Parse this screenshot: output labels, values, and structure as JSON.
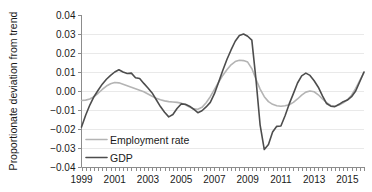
{
  "chart_data": {
    "type": "line",
    "title": "",
    "subtitle": "",
    "xlabel": "",
    "ylabel": "Proportionate deviation from trend",
    "xlim": [
      1999.0,
      2016.0
    ],
    "ylim": [
      -0.04,
      0.04
    ],
    "grid": true,
    "grid_axis": "y",
    "legend_position": "inside-bottom-left",
    "y_ticks": [
      0.04,
      0.03,
      0.02,
      0.01,
      0.0,
      -0.01,
      -0.02,
      -0.03,
      -0.04
    ],
    "y_tick_labels": [
      "0.04",
      "0.03",
      "0.02",
      "0.01",
      "0.00",
      "−0.01",
      "−0.02",
      "−0.03",
      "−0.04"
    ],
    "x_ticks": [
      1999,
      2001,
      2003,
      2005,
      2007,
      2009,
      2011,
      2013,
      2015
    ],
    "x_tick_labels": [
      "1999",
      "2001",
      "2003",
      "2005",
      "2007",
      "2009",
      "2011",
      "2013",
      "2015"
    ],
    "x_minor_tick_interval": 0.25,
    "series": [
      {
        "name": "Employment rate",
        "color": "#b4b4b4",
        "width": 1.6,
        "x": [
          1999.0,
          1999.25,
          1999.5,
          1999.75,
          2000.0,
          2000.25,
          2000.5,
          2000.75,
          2001.0,
          2001.25,
          2001.5,
          2001.75,
          2002.0,
          2002.25,
          2002.5,
          2002.75,
          2003.0,
          2003.25,
          2003.5,
          2003.75,
          2004.0,
          2004.25,
          2004.5,
          2004.75,
          2005.0,
          2005.25,
          2005.5,
          2005.75,
          2006.0,
          2006.25,
          2006.5,
          2006.75,
          2007.0,
          2007.25,
          2007.5,
          2007.75,
          2008.0,
          2008.25,
          2008.5,
          2008.75,
          2009.0,
          2009.25,
          2009.5,
          2009.75,
          2010.0,
          2010.25,
          2010.5,
          2010.75,
          2011.0,
          2011.25,
          2011.5,
          2011.75,
          2012.0,
          2012.25,
          2012.5,
          2012.75,
          2013.0,
          2013.25,
          2013.5,
          2013.75,
          2014.0,
          2014.25,
          2014.5,
          2014.75,
          2015.0,
          2015.25,
          2015.5,
          2015.75,
          2016.0
        ],
        "values": [
          -0.005,
          -0.0048,
          -0.0042,
          -0.003,
          -0.0012,
          0.0008,
          0.0026,
          0.0038,
          0.0045,
          0.0043,
          0.0036,
          0.0028,
          0.002,
          0.0012,
          0.0004,
          -0.0004,
          -0.0016,
          -0.0028,
          -0.0038,
          -0.0046,
          -0.0052,
          -0.0056,
          -0.0058,
          -0.006,
          -0.0064,
          -0.0072,
          -0.0084,
          -0.0094,
          -0.0096,
          -0.0086,
          -0.0062,
          -0.003,
          0.0008,
          0.0046,
          0.0082,
          0.0112,
          0.0138,
          0.0155,
          0.0162,
          0.016,
          0.0152,
          0.0118,
          0.0062,
          0.001,
          -0.003,
          -0.0056,
          -0.007,
          -0.0078,
          -0.008,
          -0.0078,
          -0.0072,
          -0.006,
          -0.0042,
          -0.0022,
          -0.0006,
          0.0,
          -0.0004,
          -0.002,
          -0.0042,
          -0.0062,
          -0.0076,
          -0.008,
          -0.0074,
          -0.0062,
          -0.0046,
          -0.0022,
          0.0014,
          0.0056,
          0.0098
        ]
      },
      {
        "name": "GDP",
        "color": "#4d4d4d",
        "width": 1.6,
        "x": [
          1999.0,
          1999.25,
          1999.5,
          1999.75,
          2000.0,
          2000.25,
          2000.5,
          2000.75,
          2001.0,
          2001.25,
          2001.5,
          2001.75,
          2002.0,
          2002.25,
          2002.5,
          2002.75,
          2003.0,
          2003.25,
          2003.5,
          2003.75,
          2004.0,
          2004.25,
          2004.5,
          2004.75,
          2005.0,
          2005.25,
          2005.5,
          2005.75,
          2006.0,
          2006.25,
          2006.5,
          2006.75,
          2007.0,
          2007.25,
          2007.5,
          2007.75,
          2008.0,
          2008.25,
          2008.5,
          2008.75,
          2009.0,
          2009.25,
          2009.5,
          2009.75,
          2010.0,
          2010.25,
          2010.5,
          2010.75,
          2011.0,
          2011.25,
          2011.5,
          2011.75,
          2012.0,
          2012.25,
          2012.5,
          2012.75,
          2013.0,
          2013.25,
          2013.5,
          2013.75,
          2014.0,
          2014.25,
          2014.5,
          2014.75,
          2015.0,
          2015.25,
          2015.5,
          2015.75,
          2016.0
        ],
        "values": [
          -0.019,
          -0.0128,
          -0.0074,
          -0.003,
          0.0004,
          0.0036,
          0.0062,
          0.0082,
          0.01,
          0.0112,
          0.01,
          0.0092,
          0.0094,
          0.007,
          0.0066,
          0.004,
          0.0016,
          -0.001,
          -0.0046,
          -0.0082,
          -0.0112,
          -0.0136,
          -0.0124,
          -0.0092,
          -0.0068,
          -0.007,
          -0.008,
          -0.0096,
          -0.0114,
          -0.0104,
          -0.0084,
          -0.006,
          -0.0014,
          0.0046,
          0.0108,
          0.0166,
          0.0216,
          0.0262,
          0.0292,
          0.03,
          0.0288,
          0.0268,
          0.006,
          -0.018,
          -0.0308,
          -0.0282,
          -0.0216,
          -0.0186,
          -0.0184,
          -0.013,
          -0.0068,
          -0.0014,
          0.0042,
          0.008,
          0.0094,
          0.0082,
          0.0054,
          0.002,
          -0.0026,
          -0.0066,
          -0.008,
          -0.0082,
          -0.007,
          -0.0056,
          -0.0048,
          -0.003,
          0.0,
          0.005,
          0.01
        ]
      }
    ],
    "legend": [
      {
        "label": "Employment rate",
        "color": "#b4b4b4"
      },
      {
        "label": "GDP",
        "color": "#4d4d4d"
      }
    ]
  },
  "colors": {
    "background": "#ffffff",
    "grid": "#e9e9e9",
    "axis": "#8c8c8c",
    "text": "#1a1a1a",
    "employment": "#b4b4b4",
    "gdp": "#4d4d4d"
  }
}
